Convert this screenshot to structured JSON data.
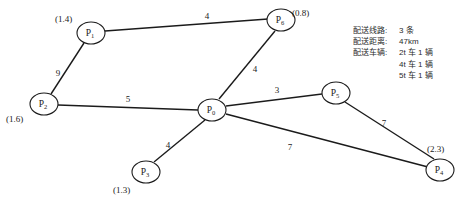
{
  "diagram": {
    "nodes": [
      {
        "id": "P1",
        "label": "P",
        "sub": "1",
        "x": 91,
        "y": 33,
        "rx": 14,
        "ry": 11,
        "demand": "(1.4)",
        "demand_x": 55,
        "demand_y": 22
      },
      {
        "id": "P2",
        "label": "P",
        "sub": "2",
        "x": 44,
        "y": 104,
        "rx": 14,
        "ry": 11,
        "demand": "(1.6)",
        "demand_x": 6,
        "demand_y": 122
      },
      {
        "id": "P3",
        "label": "P",
        "sub": "3",
        "x": 146,
        "y": 172,
        "rx": 14,
        "ry": 11,
        "demand": "(1.3)",
        "demand_x": 113,
        "demand_y": 193
      },
      {
        "id": "P4",
        "label": "P",
        "sub": "4",
        "x": 440,
        "y": 170,
        "rx": 14,
        "ry": 11,
        "demand": "(2.3)",
        "demand_x": 427,
        "demand_y": 152
      },
      {
        "id": "P5",
        "label": "P",
        "sub": "5",
        "x": 336,
        "y": 93,
        "rx": 14,
        "ry": 11,
        "demand": "",
        "demand_x": 0,
        "demand_y": 0
      },
      {
        "id": "P6",
        "label": "P",
        "sub": "6",
        "x": 281,
        "y": 20,
        "rx": 14,
        "ry": 11,
        "demand": "(0.8)",
        "demand_x": 292,
        "demand_y": 16
      },
      {
        "id": "P0",
        "label": "P",
        "sub": "0",
        "x": 212,
        "y": 110,
        "rx": 14,
        "ry": 11,
        "demand": "",
        "demand_x": 0,
        "demand_y": 0
      }
    ],
    "edges": [
      {
        "from": "P1",
        "to": "P6",
        "weight": "4",
        "x1": 105,
        "y1": 31,
        "x2": 268,
        "y2": 19,
        "lx": 207,
        "ly": 19
      },
      {
        "from": "P1",
        "to": "P2",
        "weight": "9",
        "x1": 84,
        "y1": 43,
        "x2": 51,
        "y2": 94,
        "lx": 58,
        "ly": 76
      },
      {
        "from": "P2",
        "to": "P0",
        "weight": "5",
        "x1": 58,
        "y1": 105,
        "x2": 198,
        "y2": 110,
        "lx": 128,
        "ly": 102
      },
      {
        "from": "P0",
        "to": "P6",
        "weight": "4",
        "x1": 219,
        "y1": 99,
        "x2": 275,
        "y2": 31,
        "lx": 255,
        "ly": 72
      },
      {
        "from": "P0",
        "to": "P3",
        "weight": "4",
        "x1": 205,
        "y1": 120,
        "x2": 154,
        "y2": 162,
        "lx": 168,
        "ly": 148
      },
      {
        "from": "P0",
        "to": "P5",
        "weight": "3",
        "x1": 226,
        "y1": 106,
        "x2": 322,
        "y2": 94,
        "lx": 277,
        "ly": 93
      },
      {
        "from": "P0",
        "to": "P4",
        "weight": "7",
        "x1": 226,
        "y1": 114,
        "x2": 428,
        "y2": 167,
        "lx": 290,
        "ly": 150
      },
      {
        "from": "P5",
        "to": "P4",
        "weight": "7",
        "x1": 345,
        "y1": 102,
        "x2": 434,
        "y2": 159,
        "lx": 384,
        "ly": 126
      }
    ]
  },
  "legend": {
    "rows": [
      {
        "key": "配送线路:",
        "value": "3 条",
        "continuation": false
      },
      {
        "key": "配送距离:",
        "value": "47km",
        "continuation": false
      },
      {
        "key": "配送车辆:",
        "value": "2t 车 1 辆",
        "continuation": false
      },
      {
        "key": "配送车辆:",
        "value": "4t 车 1 辆",
        "continuation": true
      },
      {
        "key": "配送车辆:",
        "value": "5t 车 1 辆",
        "continuation": true
      }
    ]
  }
}
